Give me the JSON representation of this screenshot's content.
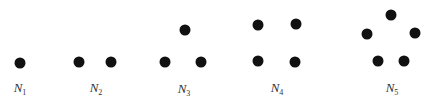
{
  "diagram": {
    "dot_color": "#111111",
    "label_color": "#333333",
    "figures": [
      {
        "id": "N1",
        "label_base": "N",
        "label_sub": "1",
        "label_pos": [
          20,
          88
        ],
        "dots": [
          [
            20,
            63
          ]
        ]
      },
      {
        "id": "N2",
        "label_base": "N",
        "label_sub": "2",
        "label_pos": [
          96,
          88
        ],
        "dots": [
          [
            79,
            62
          ],
          [
            111,
            62
          ]
        ]
      },
      {
        "id": "N3",
        "label_base": "N",
        "label_sub": "3",
        "label_pos": [
          184,
          89
        ],
        "dots": [
          [
            165,
            62
          ],
          [
            185,
            30
          ],
          [
            201,
            62
          ]
        ]
      },
      {
        "id": "N4",
        "label_base": "N",
        "label_sub": "4",
        "label_pos": [
          277,
          88
        ],
        "dots": [
          [
            258,
            25
          ],
          [
            296,
            24
          ],
          [
            258,
            61
          ],
          [
            295,
            62
          ]
        ]
      },
      {
        "id": "N5",
        "label_base": "N",
        "label_sub": "5",
        "label_pos": [
          392,
          88
        ],
        "dots": [
          [
            391,
            15
          ],
          [
            367,
            34
          ],
          [
            415,
            33
          ],
          [
            378,
            61
          ],
          [
            404,
            61
          ]
        ]
      }
    ]
  }
}
